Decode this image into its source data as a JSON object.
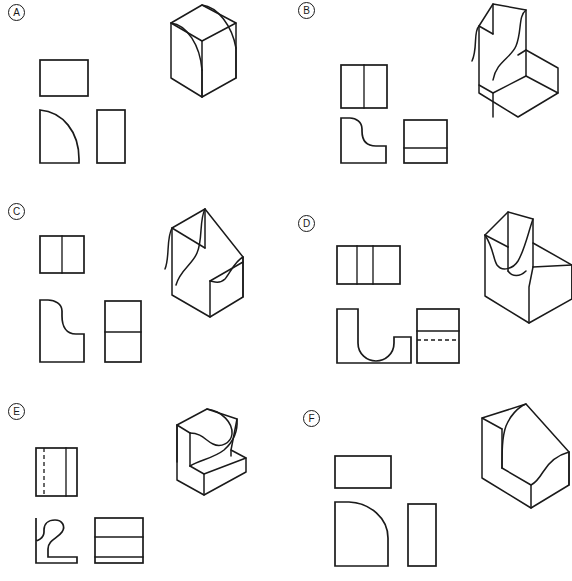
{
  "sheet": {
    "width": 572,
    "height": 581,
    "background_color": "#ffffff",
    "line_color": "#1a1a1a",
    "description": "Engineering graphics exercise sheet: six lettered problems, each pairing a set of multiview orthographic projections (top view, front view, right-side view) with a pictorial isometric drawing of the same object."
  },
  "panels": [
    {
      "id": "A",
      "label": "A",
      "label_style": "circled-letter",
      "origin": {
        "x": 0,
        "y": 0
      },
      "object_name": "quarter-round-fillet-block",
      "views": [
        {
          "name": "top-view",
          "outline": "plain rectangle",
          "interior_lines": [],
          "hidden_lines": []
        },
        {
          "name": "front-view",
          "outline": "square with large quarter-round convex arc cut from upper-right corner",
          "interior_lines": [],
          "hidden_lines": []
        },
        {
          "name": "right-side-view",
          "outline": "plain tall rectangle",
          "interior_lines": [],
          "hidden_lines": []
        }
      ],
      "isometric": {
        "name": "isometric-view",
        "feature": "single quarter-round (convex fillet) sweeping from top face down to right face"
      }
    },
    {
      "id": "B",
      "label": "B",
      "label_style": "circled-letter",
      "origin": {
        "x": 286,
        "y": 0
      },
      "object_name": "ogee-curve-upright-block",
      "views": [
        {
          "name": "top-view",
          "outline": "rectangle",
          "interior_lines": [
            "one vertical division line"
          ],
          "hidden_lines": []
        },
        {
          "name": "front-view",
          "outline": "tall L shape with S-curve (ogee) descending from top-left to lower-right step",
          "interior_lines": [],
          "hidden_lines": []
        },
        {
          "name": "right-side-view",
          "outline": "rectangle",
          "interior_lines": [
            "one horizontal division line in lower third"
          ],
          "hidden_lines": []
        }
      ],
      "isometric": {
        "name": "isometric-view",
        "feature": "tall upright slab with ogee S-curve face rising from a low base ledge"
      }
    },
    {
      "id": "C",
      "label": "C",
      "label_style": "circled-letter",
      "origin": {
        "x": 0,
        "y": 195
      },
      "object_name": "ogee-curve-tall-block",
      "views": [
        {
          "name": "top-view",
          "outline": "rectangle",
          "interior_lines": [
            "one vertical division line"
          ],
          "hidden_lines": []
        },
        {
          "name": "front-view",
          "outline": "tall shape with S-curve (ogee) descending from top-left to a short right step",
          "interior_lines": [],
          "hidden_lines": []
        },
        {
          "name": "right-side-view",
          "outline": "tall rectangle",
          "interior_lines": [
            "one horizontal division line at mid-height"
          ],
          "hidden_lines": []
        }
      ],
      "isometric": {
        "name": "isometric-view",
        "feature": "tall block with ogee S-curve front face descending to a lower rear shelf"
      }
    },
    {
      "id": "D",
      "label": "D",
      "label_style": "circled-letter",
      "origin": {
        "x": 286,
        "y": 195
      },
      "object_name": "u-slot-saddle-block",
      "views": [
        {
          "name": "top-view",
          "outline": "wide rectangle",
          "interior_lines": [
            "two vertical division lines"
          ],
          "hidden_lines": []
        },
        {
          "name": "front-view",
          "outline": "U-shaped saddle: tall left wall, semicircular slot floor, lower right step",
          "interior_lines": [],
          "hidden_lines": []
        },
        {
          "name": "right-side-view",
          "outline": "rectangle",
          "interior_lines": [
            "one solid horizontal line upper area"
          ],
          "hidden_lines": [
            "one dashed horizontal line just below the solid line"
          ]
        }
      ],
      "isometric": {
        "name": "isometric-view",
        "feature": "saddle block with concave semicircular slot between a tall left wall and a lower right block"
      }
    },
    {
      "id": "E",
      "label": "E",
      "label_style": "circled-letter",
      "origin": {
        "x": 0,
        "y": 390
      },
      "object_name": "reverse-curve-overhang-block",
      "views": [
        {
          "name": "top-view",
          "outline": "rectangle",
          "interior_lines": [
            "one solid vertical line toward the right"
          ],
          "hidden_lines": [
            "one dashed vertical line toward the left"
          ]
        },
        {
          "name": "front-view",
          "outline": "reverse S-curve profile with overhanging upper lip and stepped base",
          "interior_lines": [],
          "hidden_lines": []
        },
        {
          "name": "right-side-view",
          "outline": "rectangle",
          "interior_lines": [
            "two horizontal division lines"
          ],
          "hidden_lines": []
        }
      ],
      "isometric": {
        "name": "isometric-view",
        "feature": "block with reverse (undercut) S-curve forming an overhanging top lobe above a concave hollow and flat base slab"
      }
    },
    {
      "id": "F",
      "label": "F",
      "label_style": "circled-letter",
      "origin": {
        "x": 286,
        "y": 390
      },
      "object_name": "elliptical-corner-block",
      "views": [
        {
          "name": "top-view",
          "outline": "wide plain rectangle",
          "interior_lines": [],
          "hidden_lines": []
        },
        {
          "name": "front-view",
          "outline": "block with large elliptical curve removing the upper-right corner",
          "interior_lines": [],
          "hidden_lines": []
        },
        {
          "name": "right-side-view",
          "outline": "plain tall narrow rectangle",
          "interior_lines": [],
          "hidden_lines": []
        }
      ],
      "isometric": {
        "name": "isometric-view",
        "feature": "upright block with a sweeping elliptical curve cutting the top-front corner down to the base"
      }
    }
  ]
}
